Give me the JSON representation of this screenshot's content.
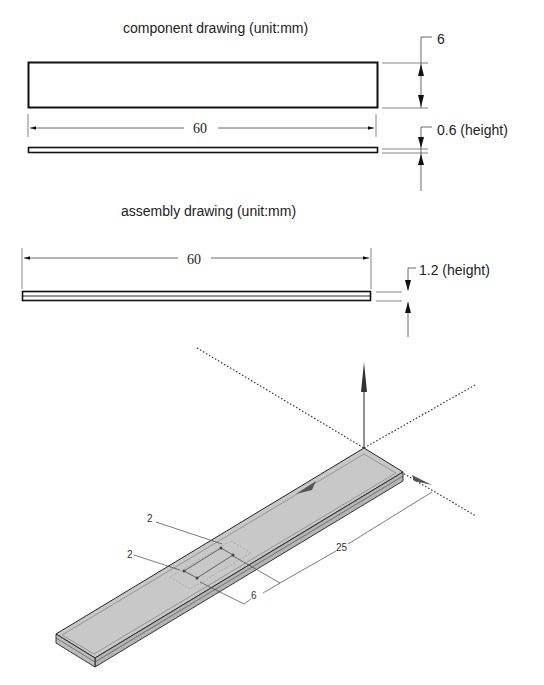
{
  "component_drawing": {
    "title": "component drawing (unit:mm)",
    "length_label": "60",
    "width_label": "6",
    "height_label": "0.6 (height)"
  },
  "assembly_drawing": {
    "title": "assembly drawing (unit:mm)",
    "length_label": "60",
    "height_label": "1.2 (height)"
  },
  "isometric_view": {
    "dim_slot_width": "2",
    "dim_slot_offset": "2",
    "dim_slot_length": "6",
    "dim_distance": "25"
  },
  "colors": {
    "line": "#111111",
    "plate_fill": "#c8c8c8",
    "plate_side": "#b0b0b0",
    "thin_line": "#555555"
  }
}
